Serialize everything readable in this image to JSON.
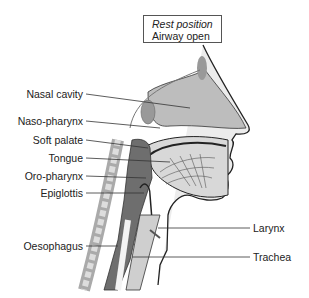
{
  "caption": {
    "line1": "Rest position",
    "line2": "Airway open"
  },
  "labels_left": [
    {
      "id": "nasal-cavity",
      "text": "Nasal cavity"
    },
    {
      "id": "naso-pharynx",
      "text": "Naso-pharynx"
    },
    {
      "id": "soft-palate",
      "text": "Soft palate"
    },
    {
      "id": "tongue",
      "text": "Tongue"
    },
    {
      "id": "oro-pharynx",
      "text": "Oro-pharynx"
    },
    {
      "id": "epiglottis",
      "text": "Epiglottis"
    },
    {
      "id": "oesophagus",
      "text": "Oesophagus"
    }
  ],
  "labels_right": [
    {
      "id": "larynx",
      "text": "Larynx"
    },
    {
      "id": "trachea",
      "text": "Trachea"
    }
  ],
  "colors": {
    "outline": "#222222",
    "skin": "#e6e6e6",
    "airway_dark": "#6e6e6e",
    "cavity": "#bdbdbd",
    "bone": "#f2f2f2"
  }
}
